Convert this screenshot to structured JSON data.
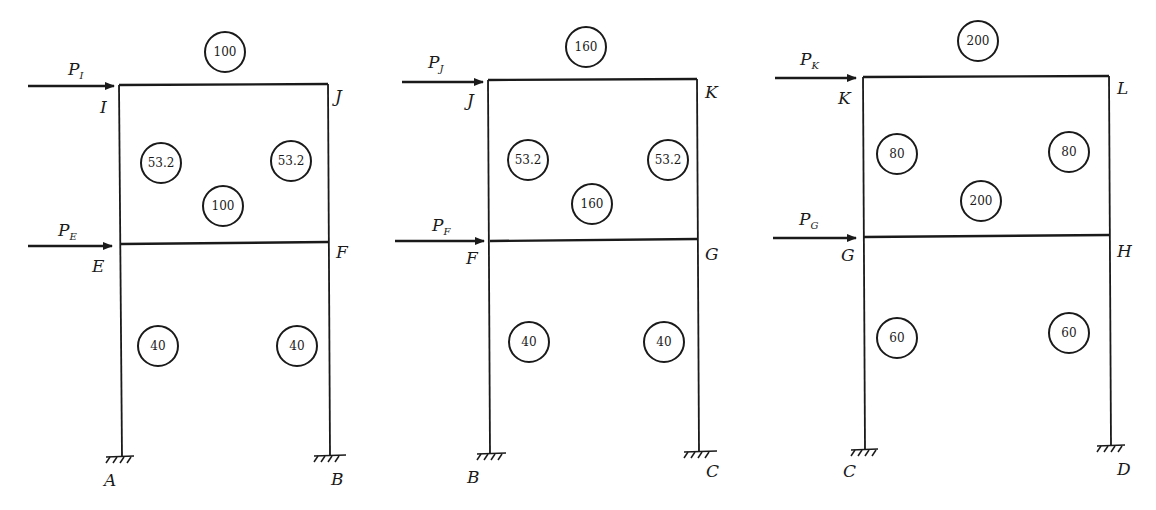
{
  "diagram": {
    "type": "portal-frame-stiffness-diagrams",
    "frames": [
      {
        "id": "frame-1",
        "top_beam": {
          "left_node": "I",
          "right_node": "J",
          "stiffness": "100"
        },
        "upper_columns": {
          "left": "53.2",
          "right": "53.2"
        },
        "middle_beam": {
          "left_node": "E",
          "right_node": "F",
          "stiffness": "100"
        },
        "lower_columns": {
          "left": "40",
          "right": "40"
        },
        "supports": {
          "left": "A",
          "right": "B"
        },
        "loads": [
          {
            "label": "P",
            "sub": "I"
          },
          {
            "label": "P",
            "sub": "E"
          }
        ]
      },
      {
        "id": "frame-2",
        "top_beam": {
          "left_node": "J",
          "right_node": "K",
          "stiffness": "160"
        },
        "upper_columns": {
          "left": "53.2",
          "right": "53.2"
        },
        "middle_beam": {
          "left_node": "F",
          "right_node": "G",
          "stiffness": "160"
        },
        "lower_columns": {
          "left": "40",
          "right": "40"
        },
        "supports": {
          "left": "B",
          "right": "C"
        },
        "loads": [
          {
            "label": "P",
            "sub": "J"
          },
          {
            "label": "P",
            "sub": "F"
          }
        ]
      },
      {
        "id": "frame-3",
        "top_beam": {
          "left_node": "K",
          "right_node": "L",
          "stiffness": "200"
        },
        "upper_columns": {
          "left": "80",
          "right": "80"
        },
        "middle_beam": {
          "left_node": "G",
          "right_node": "H",
          "stiffness": "200"
        },
        "lower_columns": {
          "left": "60",
          "right": "60"
        },
        "supports": {
          "left": "C",
          "right": "D"
        },
        "loads": [
          {
            "label": "P",
            "sub": "K"
          },
          {
            "label": "P",
            "sub": "G"
          }
        ]
      }
    ]
  }
}
